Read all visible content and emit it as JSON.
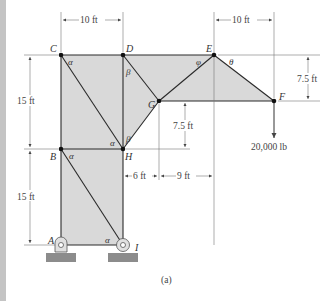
{
  "figure": {
    "caption": "(a)",
    "colors": {
      "fill": "#d9d9d9",
      "member": "#2a2a2a",
      "joint": "#111111",
      "ground": "#8c8c8c",
      "dimension": "#555555"
    },
    "joints": [
      {
        "id": "A",
        "label": "A"
      },
      {
        "id": "B",
        "label": "B"
      },
      {
        "id": "C",
        "label": "C"
      },
      {
        "id": "D",
        "label": "D"
      },
      {
        "id": "E",
        "label": "E"
      },
      {
        "id": "F",
        "label": "F"
      },
      {
        "id": "G",
        "label": "G"
      },
      {
        "id": "H",
        "label": "H"
      },
      {
        "id": "I",
        "label": "I"
      }
    ],
    "angles": {
      "alpha": "α",
      "beta": "β",
      "phi": "φ",
      "theta": "θ"
    },
    "dimensions": {
      "cd_width": "10 ft",
      "ef_width": "10 ft",
      "ef_height": "7.5 ft",
      "bc_height": "15 ft",
      "ab_height": "15 ft",
      "gh_height": "7.5 ft",
      "hg_horizontal": "6 ft",
      "ge_horizontal": "9 ft"
    },
    "load": {
      "value": "20,000 lb",
      "joint": "F",
      "direction": "down"
    }
  }
}
